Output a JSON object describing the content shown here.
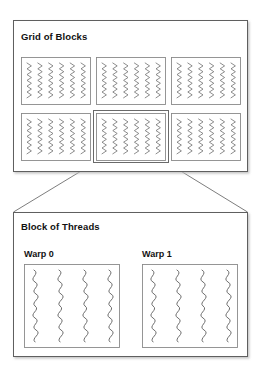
{
  "diagram": {
    "title_implicit": "CUDA execution hierarchy",
    "background_color": "#ffffff",
    "line_color": "#6e6e6e",
    "dark_line_color": "#4a4a4a",
    "text_color": "#111111",
    "shadow_color": "#cfcfcf"
  },
  "grid_panel": {
    "title": "Grid of Blocks",
    "frame": {
      "x": 13,
      "y": 20,
      "w": 235,
      "h": 152
    },
    "blocks": [
      {
        "name": "block-0-0",
        "x": 21,
        "y": 57,
        "w": 70,
        "h": 48,
        "threads": 6,
        "highlighted": false
      },
      {
        "name": "block-0-1",
        "x": 96,
        "y": 57,
        "w": 70,
        "h": 48,
        "threads": 6,
        "highlighted": false
      },
      {
        "name": "block-0-2",
        "x": 171,
        "y": 57,
        "w": 70,
        "h": 48,
        "threads": 6,
        "highlighted": false
      },
      {
        "name": "block-1-0",
        "x": 21,
        "y": 113,
        "w": 70,
        "h": 48,
        "threads": 6,
        "highlighted": false
      },
      {
        "name": "block-1-1",
        "x": 96,
        "y": 113,
        "w": 70,
        "h": 48,
        "threads": 6,
        "highlighted": true
      },
      {
        "name": "block-1-2",
        "x": 171,
        "y": 113,
        "w": 70,
        "h": 48,
        "threads": 6,
        "highlighted": false
      }
    ],
    "block_count": 6,
    "threads_per_block_drawn": 6
  },
  "block_panel": {
    "title": "Block of Threads",
    "frame": {
      "x": 13,
      "y": 212,
      "w": 235,
      "h": 145
    },
    "warps": [
      {
        "label": "Warp 0",
        "name": "warp-0",
        "box": {
          "x": 24,
          "y": 264,
          "w": 96,
          "h": 84
        },
        "threads": 4
      },
      {
        "label": "Warp 1",
        "name": "warp-1",
        "box": {
          "x": 142,
          "y": 264,
          "w": 96,
          "h": 84
        },
        "threads": 4
      }
    ],
    "warp_count": 2,
    "threads_per_warp_drawn": 4
  },
  "connectors": [
    {
      "name": "connector-left",
      "x1": 96,
      "y1": 162,
      "x2": 13,
      "y2": 212
    },
    {
      "name": "connector-right",
      "x1": 166,
      "y1": 162,
      "x2": 248,
      "y2": 212
    }
  ]
}
